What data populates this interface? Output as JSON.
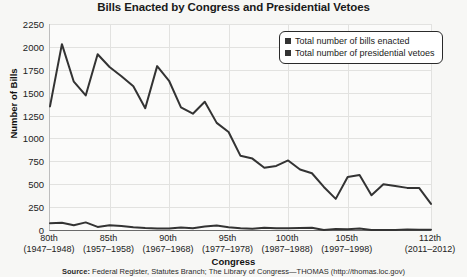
{
  "chart_data": {
    "type": "line",
    "title": "Bills Enacted by Congress and Presidential Vetoes",
    "xlabel": "Congress",
    "ylabel": "Number of Bills",
    "ylim": [
      0,
      2250
    ],
    "ytick_step": 250,
    "yticks": [
      0,
      250,
      500,
      750,
      1000,
      1250,
      1500,
      1750,
      2000,
      2250
    ],
    "grid": true,
    "legend_position": "top-right",
    "x_tick_labels": [
      {
        "num": "80th",
        "years": "(1947–1948)"
      },
      {
        "num": "85th",
        "years": "(1957–1958)"
      },
      {
        "num": "90th",
        "years": "(1967–1968)"
      },
      {
        "num": "95th",
        "years": "(1977–1978)"
      },
      {
        "num": "100th",
        "years": "(1987–1988)"
      },
      {
        "num": "105th",
        "years": "(1997–1998)"
      },
      {
        "num": "112th",
        "years": "(2011–2012)"
      }
    ],
    "categories": [
      "80th",
      "81st",
      "82nd",
      "83rd",
      "84th",
      "85th",
      "86th",
      "87th",
      "88th",
      "89th",
      "90th",
      "91st",
      "92nd",
      "93rd",
      "94th",
      "95th",
      "96th",
      "97th",
      "98th",
      "99th",
      "100th",
      "101st",
      "102nd",
      "103rd",
      "104th",
      "105th",
      "106th",
      "107th",
      "108th",
      "109th",
      "110th",
      "111th",
      "112th"
    ],
    "series": [
      {
        "name": "Total number of bills enacted",
        "color": "#333333",
        "values": [
          1350,
          2030,
          1620,
          1470,
          1920,
          1780,
          1680,
          1570,
          1330,
          1790,
          1630,
          1340,
          1270,
          1400,
          1170,
          1070,
          810,
          780,
          680,
          700,
          760,
          660,
          620,
          470,
          340,
          580,
          600,
          380,
          500,
          480,
          460,
          460,
          285
        ]
      },
      {
        "name": "Total number of presidential vetoes",
        "color": "#333333",
        "values": [
          75,
          80,
          52,
          83,
          34,
          51,
          44,
          30,
          21,
          17,
          16,
          28,
          20,
          39,
          48,
          31,
          19,
          15,
          24,
          20,
          19,
          21,
          25,
          0,
          11,
          8,
          17,
          0,
          0,
          1,
          5,
          2,
          2
        ]
      }
    ],
    "source_prefix": "Source:",
    "source_text": " Federal Register, Statutes Branch; The Library of Congress—THOMAS (http://thomas.loc.gov)"
  },
  "legend": {
    "entries": [
      {
        "label": "Total number of bills enacted"
      },
      {
        "label": "Total number of presidential vetoes"
      }
    ]
  }
}
